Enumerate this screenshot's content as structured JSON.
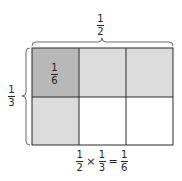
{
  "top_label": {
    "num": "1",
    "den": "2"
  },
  "left_label": {
    "num": "1",
    "den": "3"
  },
  "cell_label": {
    "num": "1",
    "den": "6"
  },
  "equation": {
    "a": {
      "num": "1",
      "den": "2"
    },
    "times": "×",
    "b": {
      "num": "1",
      "den": "3"
    },
    "equals": "=",
    "c": {
      "num": "1",
      "den": "6"
    }
  },
  "grid": {
    "rows": 2,
    "cols": 3,
    "colors": {
      "dark": "#b8b8b8",
      "light": "#dcdcdc",
      "white": "#ffffff",
      "line": "#2a2a2a"
    }
  }
}
